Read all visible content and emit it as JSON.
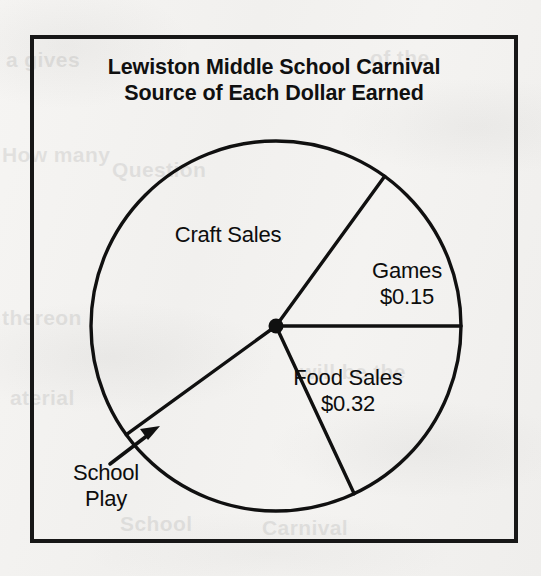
{
  "figure": {
    "title_line_1": "Lewiston Middle School Carnival",
    "title_line_2": "Source of Each Dollar Earned",
    "frame_color": "#171717",
    "ink_color": "#0d0d0d",
    "paper_color": "#f4f3f1"
  },
  "chart_data": {
    "type": "pie",
    "title": "Lewiston Middle School Carnival Source of Each Dollar Earned",
    "subtitle": "Source of Each Dollar Earned",
    "unit": "dollars per dollar earned",
    "grid": false,
    "legend": "none",
    "labels_position": "inside-slices",
    "categories": [
      "Craft Sales",
      "Games",
      "Food Sales",
      "School Play"
    ],
    "value_labels": [
      "",
      "$0.15",
      "$0.32",
      ""
    ],
    "values": [
      0.44,
      0.15,
      0.32,
      0.09
    ],
    "slices": [
      {
        "name": "Craft Sales",
        "value_label": "",
        "value": 0.44,
        "start_angle_deg": 54,
        "end_angle_deg": 216,
        "label_x": 228,
        "label_y": 235
      },
      {
        "name": "Games",
        "value_label": "$0.15",
        "value": 0.15,
        "start_angle_deg": 0,
        "end_angle_deg": 54,
        "label_x": 407,
        "label_y": 271
      },
      {
        "name": "Food Sales",
        "value_label": "$0.32",
        "value": 0.32,
        "start_angle_deg": 295,
        "end_angle_deg": 360,
        "label_x": 348,
        "label_y": 378
      },
      {
        "name": "School Play",
        "value_label": "",
        "value": 0.09,
        "start_angle_deg": 216,
        "end_angle_deg": 295,
        "label_x": 106,
        "label_y": 473,
        "label_placement": "outside-with-leader-arrow"
      }
    ],
    "geometry": {
      "center_x": 276,
      "center_y": 326,
      "radius": 185
    }
  },
  "annotations": {
    "school_play_leader": {
      "type": "arrow",
      "from_x": 112,
      "from_y": 462,
      "to_x": 158,
      "to_y": 428
    }
  },
  "background_text": [
    {
      "text": "a gives",
      "x": 6,
      "y": 60
    },
    {
      "text": "of the",
      "x": 370,
      "y": 58
    },
    {
      "text": "How many",
      "x": 2,
      "y": 155
    },
    {
      "text": "Question",
      "x": 110,
      "y": 170
    },
    {
      "text": "thereon",
      "x": 2,
      "y": 318
    },
    {
      "text": "will be the",
      "x": 298,
      "y": 372
    },
    {
      "text": "aterial",
      "x": 10,
      "y": 398
    },
    {
      "text": "School",
      "x": 120,
      "y": 524
    },
    {
      "text": "Carnival",
      "x": 260,
      "y": 528
    }
  ]
}
